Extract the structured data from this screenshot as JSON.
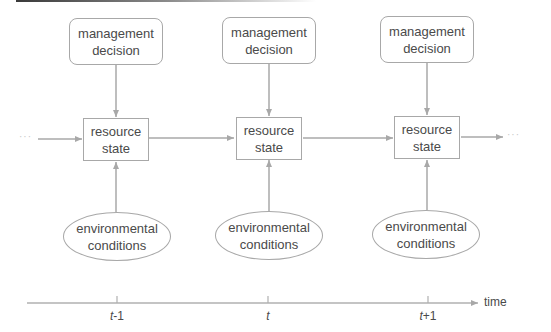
{
  "diagram": {
    "type": "dynamic decision process over time",
    "time_steps": [
      {
        "id": "t-1",
        "management_box": {
          "line1": "management",
          "line2": "decision"
        },
        "resource_box": {
          "line1": "resource",
          "line2": "state"
        },
        "environment_ellipse": {
          "line1": "environmental",
          "line2": "conditions"
        },
        "tick_label": {
          "var": "t",
          "suffix": "-1"
        }
      },
      {
        "id": "t",
        "management_box": {
          "line1": "management",
          "line2": "decision"
        },
        "resource_box": {
          "line1": "resource",
          "line2": "state"
        },
        "environment_ellipse": {
          "line1": "environmental",
          "line2": "conditions"
        },
        "tick_label": {
          "var": "t",
          "suffix": ""
        }
      },
      {
        "id": "t+1",
        "management_box": {
          "line1": "management",
          "line2": "decision"
        },
        "resource_box": {
          "line1": "resource",
          "line2": "state"
        },
        "environment_ellipse": {
          "line1": "environmental",
          "line2": "conditions"
        },
        "tick_label": {
          "var": "t",
          "suffix": "+1"
        }
      }
    ],
    "continuation_left": "···",
    "continuation_right": "···",
    "axis_label": "time",
    "edges": [
      {
        "from": "management decision",
        "to": "resource state",
        "direction": "down"
      },
      {
        "from": "environmental conditions",
        "to": "resource state",
        "direction": "up"
      },
      {
        "from": "resource state (t-1)",
        "to": "resource state (t)",
        "direction": "right"
      },
      {
        "from": "resource state (t)",
        "to": "resource state (t+1)",
        "direction": "right"
      }
    ],
    "colors": {
      "stroke": "#a8a8a8",
      "text": "#4a4a4a",
      "background": "#ffffff"
    }
  }
}
